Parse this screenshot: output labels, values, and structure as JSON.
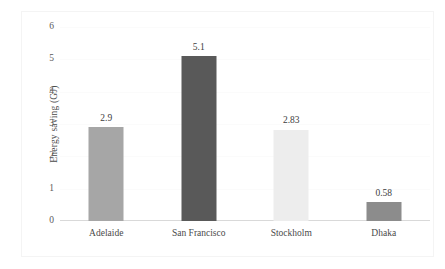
{
  "chart_data": {
    "type": "bar",
    "title": "",
    "subtitle": "",
    "xlabel": "",
    "ylabel": "Energy saving (GJ)",
    "categories": [
      "Adelaide",
      "San Francisco",
      "Stockholm",
      "Dhaka"
    ],
    "values": [
      2.9,
      5.1,
      2.83,
      0.58
    ],
    "value_labels": [
      "2.9",
      "5.1",
      "2.83",
      "0.58"
    ],
    "bar_colors": [
      "#a6a6a6",
      "#595959",
      "#ededed",
      "#8c8c8c"
    ],
    "ylim": [
      0,
      6
    ],
    "ytick_labels": [
      "0",
      "1",
      "2",
      "3",
      "4",
      "5",
      "6"
    ],
    "ytick_values": [
      0,
      1,
      2,
      3,
      4,
      5,
      6
    ],
    "grid": true,
    "legend": false,
    "legend_position": "none",
    "annotations": []
  },
  "colors": {
    "background": "#ffffff",
    "frame": "#f4f4f4",
    "axis_line": "#d9d9d9",
    "gridline": "#fbfbfb",
    "tick_text": "#5a5a5a",
    "label_text": "#4a4a4a",
    "value_text": "#3d3d3d"
  }
}
